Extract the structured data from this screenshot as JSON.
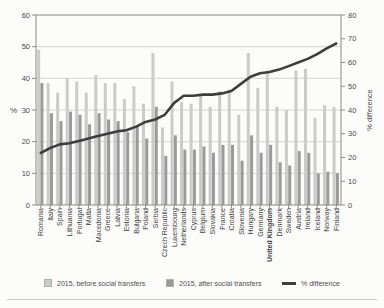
{
  "page": {
    "background": "#fcfcfa"
  },
  "chart_data": {
    "type": "bar",
    "subtype": "grouped-bars-with-line",
    "title": "",
    "categories": [
      "Romania",
      "Italy",
      "Spain",
      "Lithuania",
      "Portugal",
      "Malta",
      "Macedonia",
      "Greece",
      "Latvia",
      "Estonia",
      "Bulgaria",
      "Poland",
      "Serbia",
      "Czech Republic",
      "Luxembourg",
      "Netherlands",
      "Cyprus",
      "Belgium",
      "Slovakia",
      "France",
      "Croatia",
      "Slovenia",
      "Hungary",
      "Germany",
      "United Kingdom",
      "Denmark",
      "Sweden",
      "Austria",
      "Ireland",
      "Iceland",
      "Norway",
      "Finland"
    ],
    "bold_category": "United Kingdom",
    "series": [
      {
        "name": "2015, before social transfers",
        "type": "bar",
        "axis": "left",
        "color": "#cbcbcb",
        "values": [
          49,
          38.5,
          35.5,
          40,
          39,
          35.5,
          41,
          38.5,
          38.5,
          33.5,
          37.5,
          32,
          48,
          24.5,
          39,
          32.5,
          32,
          34.5,
          31,
          36,
          36.5,
          28.5,
          48,
          37,
          42.5,
          31,
          30,
          42.5,
          43,
          27.5,
          31.5,
          31
        ]
      },
      {
        "name": "2015, after social transfers",
        "type": "bar",
        "axis": "left",
        "color": "#9a9a9a",
        "values": [
          38.5,
          29,
          26.5,
          29.5,
          28.5,
          25.5,
          29,
          27,
          26.5,
          23,
          25,
          21,
          31,
          15.5,
          22,
          17.5,
          17.5,
          18.5,
          16.5,
          19,
          19,
          14,
          22,
          16.5,
          19,
          13.5,
          12.5,
          17,
          16.5,
          10,
          10.5,
          10
        ]
      },
      {
        "name": "% difference",
        "type": "line",
        "axis": "right",
        "color": "#3e3e3e",
        "values": [
          22,
          24,
          25.5,
          26,
          27,
          28,
          29,
          30,
          31,
          31.5,
          33,
          35,
          36,
          38,
          43,
          46,
          46,
          46.5,
          46.5,
          47,
          48,
          51,
          54,
          55.5,
          56,
          57,
          58.5,
          60,
          61.5,
          63.5,
          66,
          68
        ]
      }
    ],
    "left_axis": {
      "label": "%",
      "min": 0,
      "max": 60,
      "step": 10,
      "ticks": [
        0,
        10,
        20,
        30,
        40,
        50,
        60
      ]
    },
    "right_axis": {
      "label": "% difference",
      "min": 0,
      "max": 80,
      "step": 10,
      "ticks": [
        0,
        10,
        20,
        30,
        40,
        50,
        60,
        70,
        80
      ]
    },
    "grid": true,
    "legend_position": "bottom",
    "colors": {
      "grid": "#d4d4d2",
      "frame": "#8a8a8a",
      "tick_text": "#4a4a4a",
      "category_text": "#3e3e3e"
    }
  },
  "legend": {
    "items": [
      {
        "label": "2015, before social transfers",
        "swatch": "light-gray-square",
        "color": "#cbcbcb"
      },
      {
        "label": "2015, after social transfers",
        "swatch": "dark-gray-square",
        "color": "#9a9a9a"
      },
      {
        "label": "% difference",
        "swatch": "dark-line",
        "color": "#3e3e3e"
      }
    ]
  }
}
